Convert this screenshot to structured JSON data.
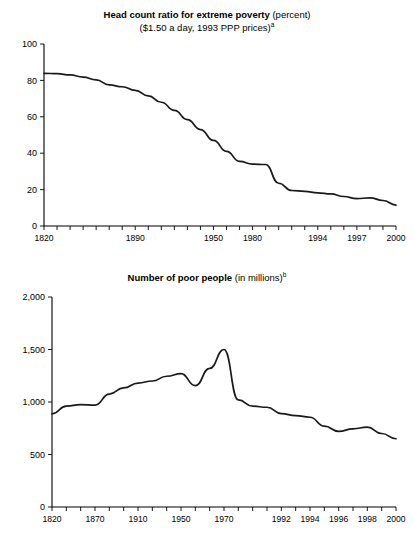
{
  "chart_data": [
    {
      "id": "head-count-ratio",
      "type": "line",
      "title_bold": "Head count ratio for extreme poverty",
      "title_rest": " (percent)",
      "subtitle": "($1.50 a day, 1993 PPP prices)",
      "subtitle_superscript": "a",
      "xlabel": "",
      "ylabel": "",
      "ylim": [
        0,
        100
      ],
      "yticks": [
        0,
        20,
        40,
        60,
        80,
        100
      ],
      "ytick_labels": [
        "0",
        "20",
        "40",
        "60",
        "80",
        "100"
      ],
      "grid": false,
      "legend": "none",
      "axis_type": "categorical-uneven-years",
      "x": [
        "1820",
        "1830",
        "1840",
        "1850",
        "1860",
        "1870",
        "1880",
        "1890",
        "1900",
        "1910",
        "1920",
        "1930",
        "1940",
        "1950",
        "1960",
        "1970",
        "1980",
        "1985",
        "1990",
        "1992",
        "1993",
        "1994",
        "1995",
        "1996",
        "1997",
        "1998",
        "1999",
        "2000"
      ],
      "xtick_labels": [
        "1820",
        "1890",
        "1950",
        "1980",
        "1994",
        "1997",
        "2000"
      ],
      "xtick_label_index": [
        0,
        7,
        13,
        16,
        21,
        24,
        27
      ],
      "values": [
        83.9,
        83.7,
        83.0,
        81.8,
        80.3,
        77.5,
        76.5,
        74.5,
        71.5,
        68.0,
        63.5,
        58.5,
        53.0,
        47.0,
        41.0,
        35.5,
        34.0,
        33.8,
        23.5,
        19.5,
        19.0,
        18.2,
        17.6,
        16.2,
        15.0,
        15.5,
        14.0,
        11.5
      ],
      "series_color": "#1a1a1a"
    },
    {
      "id": "number-of-poor-people",
      "type": "line",
      "title_bold": "Number of poor people",
      "title_rest": " (in millions)",
      "subtitle": "",
      "subtitle_superscript": "b",
      "xlabel": "",
      "ylabel": "",
      "ylim": [
        0,
        2000
      ],
      "yticks": [
        0,
        500,
        1000,
        1500,
        2000
      ],
      "ytick_labels": [
        "0",
        "500",
        "1,000",
        "1,500",
        "2,000"
      ],
      "grid": false,
      "legend": "none",
      "axis_type": "categorical-uneven-years",
      "x": [
        "1820",
        "1840",
        "1850",
        "1870",
        "1890",
        "1900",
        "1910",
        "1930",
        "1940",
        "1950",
        "1960",
        "1965",
        "1970",
        "1980",
        "1985",
        "1990",
        "1992",
        "1993",
        "1994",
        "1995",
        "1996",
        "1997",
        "1998",
        "1999",
        "2000"
      ],
      "xtick_labels": [
        "1820",
        "1870",
        "1910",
        "1950",
        "1970",
        "1992",
        "1994",
        "1996",
        "1998",
        "2000"
      ],
      "xtick_label_index": [
        0,
        3,
        6,
        9,
        12,
        16,
        18,
        20,
        22,
        24
      ],
      "values": [
        887,
        960,
        975,
        970,
        1075,
        1135,
        1180,
        1200,
        1245,
        1270,
        1155,
        1320,
        1500,
        1020,
        960,
        950,
        890,
        870,
        855,
        770,
        720,
        745,
        760,
        700,
        650
      ],
      "series_color": "#1a1a1a"
    }
  ]
}
